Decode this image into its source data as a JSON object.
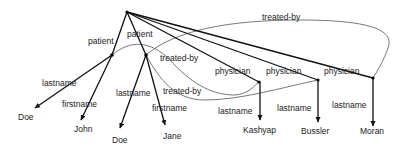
{
  "diagram": {
    "type": "tree-graph",
    "root": {
      "x": 127,
      "y": 12
    },
    "nodes": {
      "patient1": {
        "x": 112,
        "y": 55
      },
      "patient2": {
        "x": 146,
        "y": 55
      },
      "physician1": {
        "x": 259,
        "y": 82
      },
      "physician2": {
        "x": 318,
        "y": 80
      },
      "physician3": {
        "x": 373,
        "y": 78
      }
    },
    "edge_labels": {
      "patient_1": "patient",
      "patient_2": "patient",
      "physician_1": "physician",
      "physician_2": "physician",
      "physician_3": "physician",
      "lastname_1": "lastname",
      "firstname_1": "firstname",
      "lastname_2": "lastname",
      "firstname_2": "firstname",
      "lastname_3": "lastname",
      "lastname_4": "lastname",
      "lastname_5": "lastname",
      "treated_by_top": "treated-by",
      "treated_by_mid": "treated-by",
      "treated_by_low": "treated-by"
    },
    "leaf_values": {
      "doe_1": "Doe",
      "john": "John",
      "doe_2": "Doe",
      "jane": "Jane",
      "kashyap": "Kashyap",
      "bussler": "Bussler",
      "moran": "Moran"
    }
  }
}
